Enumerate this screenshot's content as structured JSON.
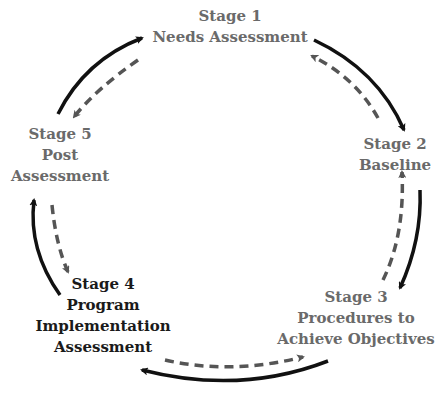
{
  "diagram": {
    "type": "cycle",
    "colors": {
      "solid_arrow": "#111111",
      "dashed_arrow": "#555555",
      "light_text": "#6a6a6a",
      "dark_text": "#1a1a1a"
    },
    "stages": [
      {
        "title": "Stage 1",
        "lines": [
          "Needs Assessment"
        ]
      },
      {
        "title": "Stage 2",
        "lines": [
          "Baseline"
        ]
      },
      {
        "title": "Stage 3",
        "lines": [
          "Procedures to",
          "Achieve Objectives"
        ]
      },
      {
        "title": "Stage 4",
        "lines": [
          "Program",
          "Implementation",
          "Assessment"
        ]
      },
      {
        "title": "Stage 5",
        "lines": [
          "Post",
          "Assessment"
        ]
      }
    ],
    "flow": {
      "solid": "clockwise: Stage 1 → Stage 2 → Stage 3 → Stage 4 → Stage 5 → Stage 1",
      "dashed": "counter-clockwise: Stage 1 → Stage 5 → Stage 4 → Stage 3 → Stage 2 → Stage 1"
    }
  }
}
